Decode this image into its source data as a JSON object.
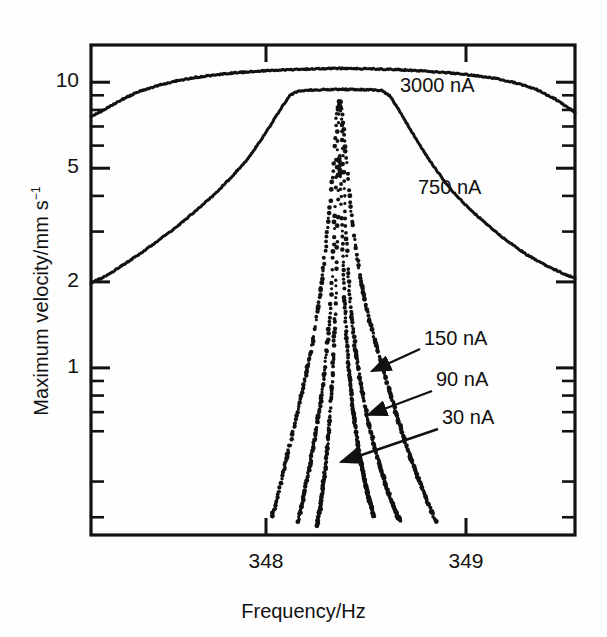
{
  "figure": {
    "background": "#fefefe",
    "ink": "#111111"
  },
  "axes": {
    "x": {
      "label": "Frequency/Hz",
      "ticks": [
        {
          "value": 348,
          "label": "348"
        },
        {
          "value": 349,
          "label": "349"
        }
      ],
      "range": [
        347.125,
        349.545
      ],
      "scale": "linear"
    },
    "y": {
      "label_text": "Maximum velocity/mm s",
      "label_exponent": "−1",
      "ticks": [
        {
          "value": 10,
          "label": "10"
        },
        {
          "value": 5,
          "label": "5"
        },
        {
          "value": 2,
          "label": "2"
        },
        {
          "value": 1,
          "label": "1"
        }
      ],
      "minor_ticks": [
        0.3,
        0.4,
        0.6,
        0.7,
        0.8,
        0.9,
        3,
        4,
        6,
        7,
        8,
        9,
        20
      ],
      "range": [
        0.26,
        13.5
      ],
      "scale": "log"
    }
  },
  "annotations": [
    {
      "name": "label-3000na",
      "text": "3000 nA",
      "x": 400,
      "y": 74,
      "arrow": false
    },
    {
      "name": "label-750na",
      "text": "750 nA",
      "x": 418,
      "y": 176,
      "arrow": false
    },
    {
      "name": "label-150na",
      "text": "150 nA",
      "x": 424,
      "y": 327,
      "arrow": true,
      "arrow_from": [
        420,
        349
      ],
      "arrow_to": [
        372,
        371
      ]
    },
    {
      "name": "label-90na",
      "text": "90 nA",
      "x": 436,
      "y": 368,
      "arrow": true,
      "arrow_from": [
        432,
        391
      ],
      "arrow_to": [
        368,
        415
      ]
    },
    {
      "name": "label-30na",
      "text": "30 nA",
      "x": 442,
      "y": 406,
      "arrow": true,
      "arrow_from": [
        438,
        429
      ],
      "arrow_to": [
        341,
        462
      ]
    }
  ],
  "chart_data": {
    "type": "line",
    "title": "",
    "xlabel": "Frequency/Hz",
    "ylabel": "Maximum velocity/mm s−1",
    "xlim": [
      347.125,
      349.545
    ],
    "ylim": [
      0.26,
      13.5
    ],
    "yscale": "log",
    "xscale": "linear",
    "grid": false,
    "legend": "inline-annotations",
    "resonance_center_hz": 348.36,
    "series": [
      {
        "name": "3000 nA",
        "drive_current_na": 3000,
        "style": "continuous",
        "peak_value": 11.2,
        "plateau_value": 11.1,
        "points": [
          [
            347.125,
            7.55
          ],
          [
            347.2,
            8.1
          ],
          [
            347.28,
            8.7
          ],
          [
            347.36,
            9.25
          ],
          [
            347.45,
            9.7
          ],
          [
            347.55,
            10.1
          ],
          [
            347.65,
            10.4
          ],
          [
            347.75,
            10.62
          ],
          [
            347.85,
            10.8
          ],
          [
            347.95,
            10.93
          ],
          [
            348.05,
            11.02
          ],
          [
            348.15,
            11.08
          ],
          [
            348.25,
            11.14
          ],
          [
            348.36,
            11.18
          ],
          [
            348.45,
            11.17
          ],
          [
            348.55,
            11.13
          ],
          [
            348.65,
            11.07
          ],
          [
            348.75,
            10.99
          ],
          [
            348.85,
            10.88
          ],
          [
            348.95,
            10.74
          ],
          [
            349.05,
            10.55
          ],
          [
            349.15,
            10.3
          ],
          [
            349.25,
            9.95
          ],
          [
            349.35,
            9.45
          ],
          [
            349.45,
            8.7
          ],
          [
            349.545,
            7.85
          ]
        ]
      },
      {
        "name": "750 nA",
        "drive_current_na": 750,
        "style": "continuous",
        "peak_value": 9.45,
        "plateau_value": 9.35,
        "points": [
          [
            347.125,
            1.98
          ],
          [
            347.2,
            2.1
          ],
          [
            347.28,
            2.28
          ],
          [
            347.36,
            2.48
          ],
          [
            347.45,
            2.75
          ],
          [
            347.55,
            3.1
          ],
          [
            347.65,
            3.55
          ],
          [
            347.75,
            4.1
          ],
          [
            347.82,
            4.6
          ],
          [
            347.9,
            5.3
          ],
          [
            347.97,
            6.2
          ],
          [
            348.03,
            7.2
          ],
          [
            348.08,
            8.2
          ],
          [
            348.12,
            9.0
          ],
          [
            348.16,
            9.33
          ],
          [
            348.22,
            9.38
          ],
          [
            348.3,
            9.42
          ],
          [
            348.36,
            9.45
          ],
          [
            348.44,
            9.43
          ],
          [
            348.52,
            9.4
          ],
          [
            348.58,
            9.34
          ],
          [
            348.62,
            8.95
          ],
          [
            348.66,
            8.1
          ],
          [
            348.71,
            7.05
          ],
          [
            348.77,
            6.0
          ],
          [
            348.84,
            5.05
          ],
          [
            348.92,
            4.25
          ],
          [
            349.0,
            3.7
          ],
          [
            349.1,
            3.2
          ],
          [
            349.2,
            2.8
          ],
          [
            349.3,
            2.5
          ],
          [
            349.4,
            2.28
          ],
          [
            349.5,
            2.12
          ],
          [
            349.545,
            2.06
          ]
        ]
      },
      {
        "name": "150 nA",
        "drive_current_na": 150,
        "style": "dotted",
        "peak_value": 8.7,
        "points": [
          [
            348.03,
            0.3
          ],
          [
            348.06,
            0.36
          ],
          [
            348.09,
            0.44
          ],
          [
            348.12,
            0.54
          ],
          [
            348.15,
            0.66
          ],
          [
            348.18,
            0.82
          ],
          [
            348.21,
            1.02
          ],
          [
            348.24,
            1.3
          ],
          [
            348.26,
            1.62
          ],
          [
            348.28,
            2.05
          ],
          [
            348.3,
            2.7
          ],
          [
            348.32,
            3.7
          ],
          [
            348.335,
            5.0
          ],
          [
            348.345,
            6.6
          ],
          [
            348.355,
            7.9
          ],
          [
            348.365,
            8.6
          ],
          [
            348.375,
            8.45
          ],
          [
            348.385,
            7.4
          ],
          [
            348.4,
            5.6
          ],
          [
            348.42,
            3.9
          ],
          [
            348.44,
            2.85
          ],
          [
            348.47,
            2.1
          ],
          [
            348.5,
            1.65
          ],
          [
            348.54,
            1.28
          ],
          [
            348.58,
            1.02
          ],
          [
            348.62,
            0.82
          ],
          [
            348.66,
            0.66
          ],
          [
            348.7,
            0.54
          ],
          [
            348.75,
            0.43
          ],
          [
            348.8,
            0.35
          ],
          [
            348.85,
            0.29
          ]
        ]
      },
      {
        "name": "90 nA",
        "drive_current_na": 90,
        "style": "dotted",
        "peak_value": 8.4,
        "points": [
          [
            348.16,
            0.29
          ],
          [
            348.19,
            0.36
          ],
          [
            348.22,
            0.46
          ],
          [
            348.25,
            0.6
          ],
          [
            348.275,
            0.78
          ],
          [
            348.295,
            1.0
          ],
          [
            348.312,
            1.32
          ],
          [
            348.325,
            1.75
          ],
          [
            348.335,
            2.4
          ],
          [
            348.345,
            3.5
          ],
          [
            348.353,
            5.2
          ],
          [
            348.36,
            7.2
          ],
          [
            348.366,
            8.35
          ],
          [
            348.373,
            8.2
          ],
          [
            348.38,
            6.8
          ],
          [
            348.388,
            4.8
          ],
          [
            348.398,
            3.2
          ],
          [
            348.41,
            2.2
          ],
          [
            348.425,
            1.58
          ],
          [
            348.445,
            1.18
          ],
          [
            348.47,
            0.9
          ],
          [
            348.5,
            0.7
          ],
          [
            348.535,
            0.55
          ],
          [
            348.575,
            0.44
          ],
          [
            348.62,
            0.35
          ],
          [
            348.67,
            0.29
          ]
        ]
      },
      {
        "name": "30 nA",
        "drive_current_na": 30,
        "style": "dotted",
        "peak_value": 5.6,
        "points": [
          [
            348.255,
            0.28
          ],
          [
            348.275,
            0.34
          ],
          [
            348.292,
            0.42
          ],
          [
            348.307,
            0.53
          ],
          [
            348.32,
            0.68
          ],
          [
            348.33,
            0.88
          ],
          [
            348.339,
            1.15
          ],
          [
            348.346,
            1.55
          ],
          [
            348.352,
            2.1
          ],
          [
            348.357,
            2.9
          ],
          [
            348.361,
            4.0
          ],
          [
            348.365,
            5.3
          ],
          [
            348.369,
            5.55
          ],
          [
            348.374,
            4.6
          ],
          [
            348.379,
            3.3
          ],
          [
            348.385,
            2.35
          ],
          [
            348.393,
            1.7
          ],
          [
            348.403,
            1.25
          ],
          [
            348.416,
            0.95
          ],
          [
            348.432,
            0.74
          ],
          [
            348.452,
            0.58
          ],
          [
            348.476,
            0.46
          ],
          [
            348.505,
            0.37
          ],
          [
            348.54,
            0.3
          ]
        ]
      }
    ]
  }
}
